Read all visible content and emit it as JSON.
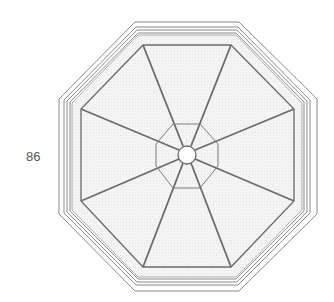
{
  "figure": {
    "label": "86",
    "colors": {
      "stroke": "#6b6b6b",
      "frame_stroke": "#8a8a8a",
      "panel_fill": "#f1f1f1",
      "label": "#555555"
    }
  }
}
